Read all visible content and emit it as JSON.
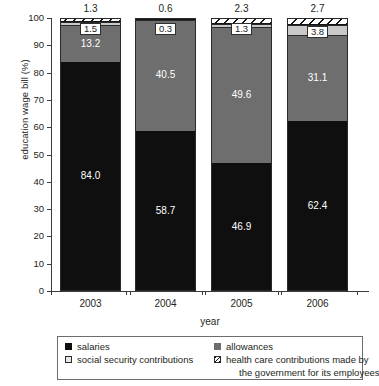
{
  "chart_data": {
    "type": "bar",
    "stacked": true,
    "title": "",
    "xlabel": "year",
    "ylabel": "education wage bill (%)",
    "categories": [
      "2003",
      "2004",
      "2005",
      "2006"
    ],
    "ylim": [
      0,
      100
    ],
    "yticks": [
      "0",
      "10",
      "20",
      "30",
      "40",
      "50",
      "60",
      "70",
      "80",
      "90",
      "100"
    ],
    "grid": false,
    "legend_position": "bottom",
    "series": [
      {
        "name": "salaries",
        "swatch": "solid-black",
        "color": "#100f0f",
        "values": [
          84.0,
          58.7,
          46.9,
          62.4
        ],
        "labels": [
          "84.0",
          "58.7",
          "46.9",
          "62.4"
        ],
        "label_style": "white-on-dark"
      },
      {
        "name": "allowances",
        "swatch": "solid-gray",
        "color": "#6e6e6e",
        "values": [
          13.2,
          40.5,
          49.6,
          31.1
        ],
        "labels": [
          "13.2",
          "40.5",
          "49.6",
          "31.1"
        ],
        "label_style": "white-on-gray"
      },
      {
        "name": "social security contributions",
        "swatch": "light-gray",
        "color": "#c9c9c9",
        "values": [
          1.5,
          0.3,
          1.3,
          3.8
        ],
        "labels": [
          "1.5",
          "0.3",
          "1.3",
          "3.8"
        ],
        "label_style": "boxed"
      },
      {
        "name": "health care contributions made by the government for its employees",
        "swatch": "diagonal-hatch",
        "color": "#ffffff",
        "values": [
          1.3,
          0.6,
          2.3,
          2.7
        ],
        "labels": [
          "1.3",
          "0.6",
          "2.3",
          "2.7"
        ],
        "label_style": "above-bar"
      }
    ]
  },
  "legend": {
    "items": [
      {
        "label": "salaries",
        "icon": "black-square-swatch"
      },
      {
        "label": "allowances",
        "icon": "gray-square-swatch"
      },
      {
        "label": "social security contributions",
        "icon": "light-square-swatch"
      },
      {
        "label": "health care contributions made by",
        "label_line2": "the government for its employees",
        "icon": "hatched-square-swatch"
      }
    ]
  }
}
